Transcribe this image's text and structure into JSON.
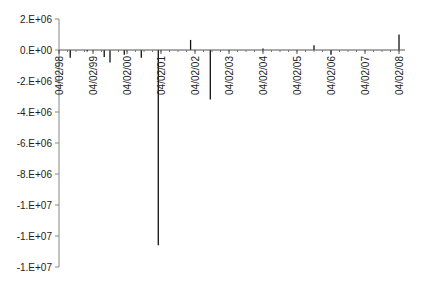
{
  "chart_data": {
    "type": "bar",
    "title": "",
    "xlabel": "",
    "ylabel": "",
    "ylim": [
      -14000000,
      2000000
    ],
    "grid": false,
    "legend": null,
    "y_tick_labels": [
      "2.E+06",
      "0.E+00",
      "-2.E+06",
      "-4.E+06",
      "-6.E+06",
      "-8.E+06",
      "-1.E+07",
      "-1.E+07",
      "-1.E+07"
    ],
    "y_tick_values": [
      2000000,
      0,
      -2000000,
      -4000000,
      -6000000,
      -8000000,
      -10000000,
      -12000000,
      -14000000
    ],
    "x_tick_labels": [
      "04/02/98",
      "04/02/99",
      "04/02/00",
      "04/02/01",
      "04/02/02",
      "04/02/03",
      "04/02/04",
      "04/02/05",
      "04/02/06",
      "04/02/07",
      "04/02/08"
    ],
    "x_range_years": [
      1998.25,
      2008.25
    ],
    "bars": [
      {
        "x": 1998.58,
        "value": -500000
      },
      {
        "x": 1999.08,
        "value": -100000
      },
      {
        "x": 1999.58,
        "value": -450000
      },
      {
        "x": 1999.75,
        "value": -800000
      },
      {
        "x": 2000.17,
        "value": -300000
      },
      {
        "x": 2000.67,
        "value": -500000
      },
      {
        "x": 2001.17,
        "value": -12600000
      },
      {
        "x": 2002.12,
        "value": 650000
      },
      {
        "x": 2002.7,
        "value": -3200000
      },
      {
        "x": 2004.25,
        "value": 100000
      },
      {
        "x": 2005.75,
        "value": 300000
      },
      {
        "x": 2006.25,
        "value": -300000
      },
      {
        "x": 2008.25,
        "value": 1000000
      }
    ]
  }
}
